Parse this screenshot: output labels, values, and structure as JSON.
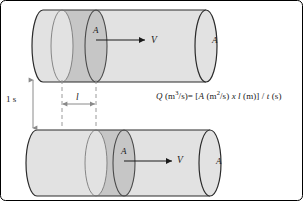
{
  "figure": {
    "background_color": "#ffffff",
    "border_color": "#000000",
    "width": 303,
    "height": 201
  },
  "colors": {
    "cylinder_light": "#e2e2e2",
    "cylinder_dark": "#c6c6c6",
    "outline": "#2b2b2b",
    "dashed_line": "#9a9a9a",
    "arrow": "#1a1a1a",
    "text": "#1a1a1a"
  },
  "cylinders": [
    {
      "id": "top",
      "area_label_mid": "A",
      "area_label_right": "A",
      "velocity_label": "V"
    },
    {
      "id": "bottom",
      "area_label_mid": "A",
      "area_label_right": "A",
      "velocity_label": "V"
    }
  ],
  "dimensions": {
    "time_label": "1 s",
    "length_label": "l"
  },
  "equation": {
    "lhs_symbol": "Q",
    "lhs_units_open": " (m",
    "lhs_units_exp": "3",
    "lhs_units_close": "/s)= [",
    "area_symbol": "A",
    "area_units_open": " (m",
    "area_units_exp": "2",
    "area_units_close": "/s) ",
    "multiply": "x",
    "length_symbol": " l",
    "length_units": " (m)] / ",
    "time_symbol": "t",
    "time_units": " (s)",
    "plain_text": "Q (m3/s)= [A (m2/s) x l (m)] / t (s)"
  }
}
